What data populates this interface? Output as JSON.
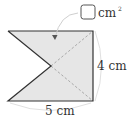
{
  "diagram": {
    "answer_box": {
      "unit": "cm",
      "exponent": "2"
    },
    "labels": {
      "height": "4 cm",
      "width": "5 cm"
    },
    "colors": {
      "fill": "#e6e6e6",
      "stroke": "#333333",
      "dashed": "#999999",
      "arc": "#cfcfcf"
    }
  }
}
